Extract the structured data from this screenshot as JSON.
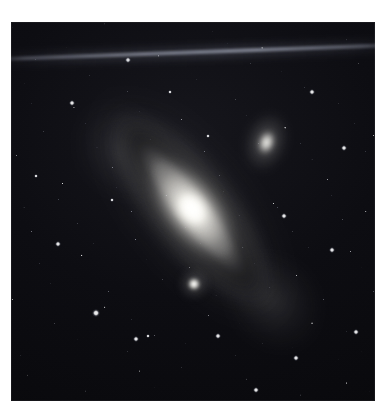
{
  "page": {
    "background_color": "#ffffff",
    "width": 388,
    "height": 417
  },
  "photograph": {
    "name": "andromeda-galaxy-plate",
    "alt_text": "Astronomical photograph of the Andromeda Galaxy (M31) with its satellite galaxies, set against a dense star field",
    "frame": {
      "x": 11,
      "y": 22,
      "width": 364,
      "height": 379
    },
    "background_color": "#07070a",
    "highlight_color": "#ffffff",
    "nebulosity_color": "#cecbc6",
    "dust_lane_color": "#0b0b0e"
  },
  "objects": [
    {
      "id": "m31",
      "label": "M31 spiral galaxy",
      "type": "spiral-galaxy",
      "center": {
        "x": 192,
        "y": 209
      },
      "position_angle_deg": 52,
      "major_axis_px": 300,
      "minor_axis_px": 138,
      "core_brightness": "saturated-white"
    },
    {
      "id": "m110",
      "label": "M110 elliptical companion",
      "type": "elliptical-galaxy",
      "center": {
        "x": 266,
        "y": 142
      },
      "position_angle_deg": 18,
      "major_axis_px": 62,
      "minor_axis_px": 44,
      "core_brightness": "bright"
    },
    {
      "id": "m32",
      "label": "M32 compact companion",
      "type": "compact-elliptical-galaxy",
      "center": {
        "x": 194,
        "y": 284
      },
      "position_angle_deg": 0,
      "major_axis_px": 32,
      "minor_axis_px": 32,
      "core_brightness": "very-bright-point"
    }
  ],
  "features": {
    "dust_lanes": [
      {
        "id": "dust-lane-outer",
        "label": "Outer dust lane",
        "position_angle_deg": 52
      },
      {
        "id": "dust-lane-inner",
        "label": "Inner dust lane",
        "position_angle_deg": 52
      }
    ],
    "spiral_arms": [
      {
        "id": "arm-nw",
        "label": "North-west spiral arm"
      },
      {
        "id": "arm-se",
        "label": "South-east spiral arm"
      }
    ],
    "trail": {
      "id": "satellite-trail",
      "label": "Satellite / scan trail",
      "tilt_deg": -2.05,
      "y_left": 58,
      "y_right": 45
    }
  },
  "bright_stars": [
    {
      "x": 72,
      "y": 103,
      "size": 3.2
    },
    {
      "x": 128,
      "y": 60,
      "size": 2.6
    },
    {
      "x": 312,
      "y": 92,
      "size": 3.0
    },
    {
      "x": 344,
      "y": 148,
      "size": 2.4
    },
    {
      "x": 58,
      "y": 244,
      "size": 2.8
    },
    {
      "x": 96,
      "y": 313,
      "size": 3.4
    },
    {
      "x": 136,
      "y": 339,
      "size": 2.6
    },
    {
      "x": 148,
      "y": 336,
      "size": 2.2
    },
    {
      "x": 218,
      "y": 336,
      "size": 2.9
    },
    {
      "x": 296,
      "y": 358,
      "size": 2.5
    },
    {
      "x": 356,
      "y": 332,
      "size": 3.1
    },
    {
      "x": 256,
      "y": 390,
      "size": 3.0
    },
    {
      "x": 36,
      "y": 176,
      "size": 2.3
    },
    {
      "x": 332,
      "y": 250,
      "size": 2.7
    },
    {
      "x": 208,
      "y": 136,
      "size": 2.2
    },
    {
      "x": 284,
      "y": 216,
      "size": 2.4
    },
    {
      "x": 112,
      "y": 200,
      "size": 2.1
    },
    {
      "x": 170,
      "y": 92,
      "size": 2.3
    }
  ]
}
